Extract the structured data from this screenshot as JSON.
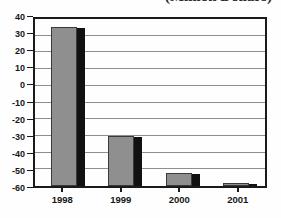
{
  "chart_data": {
    "type": "bar",
    "title": "(Million Dollars)",
    "title_note": "clipped at top edge of screenshot, only bottom sliver visible",
    "categories": [
      "1998",
      "1999",
      "2000",
      "2001"
    ],
    "values": [
      35,
      -30,
      -52,
      -58
    ],
    "xlabel": "",
    "ylabel": "",
    "ylim": [
      -60,
      40
    ],
    "ytick_step": 10,
    "yticks": [
      40,
      30,
      20,
      10,
      0,
      -10,
      -20,
      -30,
      -40,
      -50,
      -60
    ],
    "baseline": -60,
    "grid": true,
    "legend": "none",
    "colors": {
      "bar_fill": "#8f8f8f",
      "bar_border": "#3a3a3a",
      "bar_shadow": "#111111",
      "gridline": "#8f8f8f",
      "plot_border": "#1a1a1a",
      "tick": "#1a1a1a",
      "label_text": "#161616",
      "background": "#fefefe"
    }
  }
}
